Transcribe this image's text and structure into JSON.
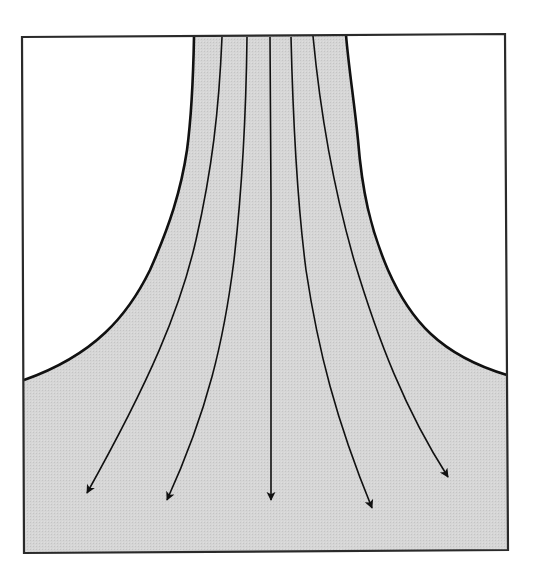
{
  "diagram": {
    "title": "Diverging flow streamlines from a narrow channel into an open region",
    "colors": {
      "background": "#ffffff",
      "fluid_fill": "#d3d3d3",
      "wall_stroke": "#1a1a1a",
      "streamline_stroke": "#1a1a1a",
      "frame_stroke": "#2a2a2a"
    },
    "frame": {
      "top_left": [
        22,
        37
      ],
      "top_right": [
        505,
        34
      ],
      "bottom_right": [
        508,
        550
      ],
      "bottom_left": [
        24,
        553
      ]
    },
    "walls": {
      "left": {
        "top": [
          194,
          37
        ],
        "points": [
          [
            194,
            37
          ],
          [
            190,
            120
          ],
          [
            173,
            205
          ],
          [
            107,
            325
          ],
          [
            24,
            380
          ]
        ]
      },
      "right": {
        "top": [
          346,
          35
        ],
        "points": [
          [
            346,
            35
          ],
          [
            357,
            120
          ],
          [
            377,
            205
          ],
          [
            420,
            325
          ],
          [
            507,
            375
          ]
        ]
      }
    },
    "streamlines": [
      {
        "id": 1,
        "start": [
          222,
          37
        ],
        "mid": [
          [
            215,
            120
          ],
          [
            202,
            205
          ],
          [
            170,
            325
          ],
          [
            137,
            405
          ]
        ],
        "tip": [
          87,
          493
        ]
      },
      {
        "id": 2,
        "start": [
          247,
          37
        ],
        "mid": [
          [
            244,
            120
          ],
          [
            238,
            205
          ],
          [
            223,
            325
          ],
          [
            203,
            405
          ]
        ],
        "tip": [
          167,
          500
        ]
      },
      {
        "id": 3,
        "start": [
          270,
          37
        ],
        "mid": [
          [
            271,
            120
          ],
          [
            271,
            205
          ],
          [
            271,
            325
          ],
          [
            271,
            405
          ]
        ],
        "tip": [
          271,
          500
        ]
      },
      {
        "id": 4,
        "start": [
          291,
          37
        ],
        "mid": [
          [
            293,
            120
          ],
          [
            298,
            205
          ],
          [
            315,
            325
          ],
          [
            333,
            405
          ]
        ],
        "tip": [
          372,
          508
        ]
      },
      {
        "id": 5,
        "start": [
          313,
          36
        ],
        "mid": [
          [
            323,
            120
          ],
          [
            340,
            205
          ],
          [
            373,
            325
          ],
          [
            407,
            405
          ]
        ],
        "tip": [
          448,
          477
        ]
      }
    ],
    "labels": {
      "fluid_region": "fluid region",
      "left_wall": "left wall",
      "right_wall": "right wall"
    }
  }
}
